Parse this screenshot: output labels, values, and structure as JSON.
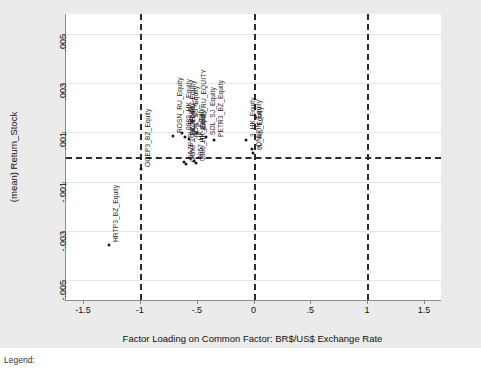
{
  "chart_data": {
    "type": "scatter",
    "title": "",
    "xlabel": "Factor Loading on Common Factor: BR$/US$ Exchange Rate",
    "ylabel": "(mean) Return_Stock",
    "xlim": [
      -1.65,
      1.65
    ],
    "ylim": [
      -0.0058,
      0.0058
    ],
    "xticks": [
      "-1.5",
      "-1",
      "-.5",
      "0",
      ".5",
      "1",
      "1.5"
    ],
    "xtickvals": [
      -1.5,
      -1,
      -0.5,
      0,
      0.5,
      1,
      1.5
    ],
    "yticks": [
      ".005",
      ".003",
      ".001",
      "-.001",
      "-.003",
      "-.005"
    ],
    "ytickvals": [
      0.005,
      0.003,
      0.001,
      -0.001,
      -0.003,
      -0.005
    ],
    "grid": "horizontal",
    "reference_lines": {
      "vertical": [
        -1,
        0,
        1
      ],
      "horizontal": [
        0
      ],
      "style": "dashed"
    },
    "legend": "none",
    "points": [
      {
        "label": "HRTP3_BZ_Equity",
        "x": -1.27,
        "y": -0.00355
      },
      {
        "label": "OGEP3_BZ_Equity",
        "x": -0.99,
        "y": -0.0005
      },
      {
        "label": "ROSN_RU_Equity",
        "x": -0.71,
        "y": 0.00085
      },
      {
        "label": "0883_HK_Equity",
        "x": -0.63,
        "y": 0.00098
      },
      {
        "label": "LKOH_RU_Equity",
        "x": -0.6,
        "y": 0.0008
      },
      {
        "label": "NOIL_SS_Equity",
        "x": -0.565,
        "y": 0.00072
      },
      {
        "label": "BANE_RU_EQUITY",
        "x": -0.5,
        "y": 0.00098
      },
      {
        "label": "SOL_SJ_Equity",
        "x": -0.42,
        "y": 0.0008
      },
      {
        "label": "PETR3_BZ_Equity",
        "x": -0.35,
        "y": 0.0007
      },
      {
        "label": "3_HK_Equity",
        "x": -0.065,
        "y": 0.0007
      },
      {
        "label": "ONL_IN_Equity",
        "x": -0.015,
        "y": 0.00032
      },
      {
        "label": "6L_HK_Equity",
        "x": -0.005,
        "y": 0.00018
      },
      {
        "label": "GAZP_RU_Equity",
        "x": -0.615,
        "y": -0.00022
      },
      {
        "label": "OGXP3_BZ_Equity",
        "x": -0.595,
        "y": -0.0003
      },
      {
        "label": "0857_HK_Equity",
        "x": -0.525,
        "y": -0.00018
      },
      {
        "label": "0386_HK_Equity",
        "x": -0.505,
        "y": -0.00026
      }
    ]
  },
  "caption": "Legend:"
}
